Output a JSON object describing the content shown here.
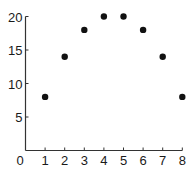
{
  "chart_data": {
    "type": "scatter",
    "title": "",
    "xlabel": "",
    "ylabel": "",
    "x": [
      1,
      2,
      3,
      4,
      5,
      6,
      7,
      8
    ],
    "y": [
      8,
      14,
      18,
      20,
      20,
      18,
      14,
      8
    ],
    "xlim": [
      0,
      8
    ],
    "ylim": [
      0,
      20
    ],
    "x_ticks": [
      "1",
      "2",
      "3",
      "4",
      "5",
      "6",
      "7",
      "8"
    ],
    "y_ticks": [
      "5",
      "10",
      "15",
      "20"
    ],
    "origin_label": "0",
    "grid": false,
    "legend": null,
    "marker_color": "#111111"
  }
}
